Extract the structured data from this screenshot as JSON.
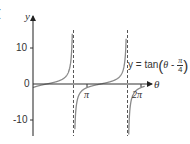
{
  "chart_data": {
    "type": "line",
    "title": "",
    "panel_label": "(",
    "function_label": {
      "prefix": "y = tan",
      "theta": "θ",
      "minus": " - ",
      "numerator": "π",
      "denominator": "4"
    },
    "xlabel": "θ",
    "ylabel": "y",
    "x_tick_labels": [
      "π",
      "2π"
    ],
    "x_ticks": [
      3.14159,
      6.28319
    ],
    "y_tick_labels": [
      "10",
      "0",
      "-10"
    ],
    "y_ticks": [
      10,
      0,
      -10
    ],
    "xlim": [
      0,
      7.4
    ],
    "ylim": [
      -14.5,
      18
    ],
    "asymptotes": [
      2.35619,
      5.49779
    ],
    "asymptote_labels": [
      "3π/4",
      "7π/4"
    ],
    "series": [
      {
        "name": "y = tan(θ - π/4)",
        "function": "tan(theta - pi/4)",
        "x_range": [
          0,
          6.5
        ],
        "color": "#8a8a8a"
      }
    ],
    "grid": false,
    "legend": "none",
    "colors": {
      "axis": "#333333",
      "curve": "#8a8a8a",
      "asymptote": "#555555"
    }
  }
}
